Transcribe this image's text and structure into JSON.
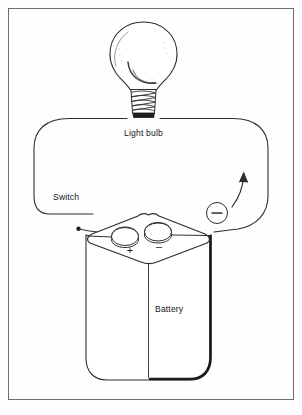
{
  "figure": {
    "frame": {
      "stroke_color": "#6a6e72",
      "background_color": "#fefefe",
      "x": 8,
      "y": 8,
      "width": 286,
      "height": 392
    },
    "line_color": "#2b2e31",
    "labels": {
      "light_bulb": "Light bulb",
      "switch": "Switch",
      "battery": "Battery",
      "positive_terminal": "+",
      "negative_terminal": "–",
      "current_marker": "–"
    },
    "components": [
      {
        "name": "light-bulb",
        "label": "Light bulb"
      },
      {
        "name": "switch",
        "label": "Switch"
      },
      {
        "name": "battery",
        "label": "Battery"
      },
      {
        "name": "current-direction-arrow",
        "label": ""
      },
      {
        "name": "negative-charge-marker",
        "label": "–"
      }
    ]
  }
}
